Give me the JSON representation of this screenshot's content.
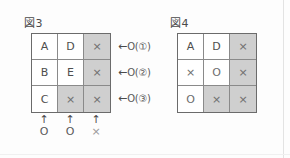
{
  "figures": [
    {
      "title": "図3",
      "grid": {
        "rows": [
          [
            {
              "text": "A",
              "shaded": false,
              "kind": "letter"
            },
            {
              "text": "D",
              "shaded": false,
              "kind": "letter"
            },
            {
              "text": "×",
              "shaded": true,
              "kind": "mark"
            }
          ],
          [
            {
              "text": "B",
              "shaded": false,
              "kind": "letter"
            },
            {
              "text": "E",
              "shaded": false,
              "kind": "letter"
            },
            {
              "text": "×",
              "shaded": true,
              "kind": "mark"
            }
          ],
          [
            {
              "text": "C",
              "shaded": false,
              "kind": "letter"
            },
            {
              "text": "×",
              "shaded": true,
              "kind": "mark"
            },
            {
              "text": "×",
              "shaded": true,
              "kind": "mark"
            }
          ]
        ]
      },
      "side_annotations": [
        {
          "arrow": "←",
          "text": "O(①)"
        },
        {
          "arrow": "←",
          "text": "O(②)"
        },
        {
          "arrow": "←",
          "text": "O(③)"
        }
      ],
      "bottom_annotations": [
        {
          "arrow": "↑",
          "symbol": "O",
          "light": false
        },
        {
          "arrow": "↑",
          "symbol": "O",
          "light": false
        },
        {
          "arrow": "↑",
          "symbol": "×",
          "light": true
        }
      ]
    },
    {
      "title": "図4",
      "grid": {
        "rows": [
          [
            {
              "text": "A",
              "shaded": false,
              "kind": "letter"
            },
            {
              "text": "D",
              "shaded": false,
              "kind": "letter"
            },
            {
              "text": "×",
              "shaded": true,
              "kind": "mark"
            }
          ],
          [
            {
              "text": "×",
              "shaded": false,
              "kind": "mark"
            },
            {
              "text": "O",
              "shaded": false,
              "kind": "mark"
            },
            {
              "text": "×",
              "shaded": true,
              "kind": "mark"
            }
          ],
          [
            {
              "text": "O",
              "shaded": false,
              "kind": "mark"
            },
            {
              "text": "×",
              "shaded": true,
              "kind": "mark"
            },
            {
              "text": "×",
              "shaded": true,
              "kind": "mark"
            }
          ]
        ]
      },
      "side_annotations": [],
      "bottom_annotations": []
    }
  ],
  "colors": {
    "page_background": "#fdfdfd",
    "cell_background": "#ffffff",
    "cell_shaded": "#cfcfcf",
    "grid_outer_border": "#6b6b6b",
    "grid_inner_border": "#8a8a8a",
    "text": "#555555"
  }
}
